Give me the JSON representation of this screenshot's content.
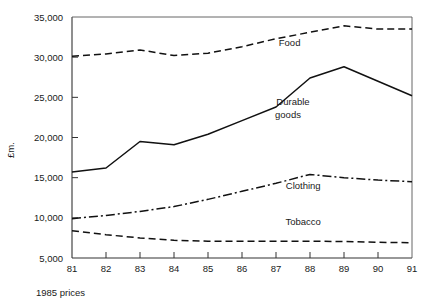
{
  "chart_data": {
    "type": "line",
    "title": "",
    "subtitle": "",
    "caption": "1985 prices",
    "xlabel": "",
    "ylabel": "£m.",
    "x": [
      81,
      82,
      83,
      84,
      85,
      86,
      87,
      88,
      89,
      90,
      91
    ],
    "xtick_labels": [
      "81",
      "82",
      "83",
      "84",
      "85",
      "86",
      "87",
      "88",
      "89",
      "90",
      "91"
    ],
    "ytick_labels": [
      "5,000",
      "10,000",
      "15,000",
      "20,000",
      "25,000",
      "30,000",
      "35,000"
    ],
    "ytick_values": [
      5000,
      10000,
      15000,
      20000,
      25000,
      30000,
      35000
    ],
    "xlim": [
      81,
      91
    ],
    "ylim": [
      5000,
      35000
    ],
    "grid": false,
    "legend_position": "inline-annotations",
    "series": [
      {
        "name": "Food",
        "style": "dashed",
        "label_x": 87.4,
        "label_y": 31400,
        "values": [
          30100,
          30400,
          30900,
          30200,
          30500,
          31300,
          32300,
          33100,
          33900,
          33500,
          33500
        ]
      },
      {
        "name": "Durable goods",
        "style": "solid",
        "label_x": 87.5,
        "label_y": 24100,
        "values": [
          15700,
          16200,
          19500,
          19100,
          20400,
          22100,
          23800,
          27400,
          28800,
          27000,
          25200
        ]
      },
      {
        "name": "Clothing",
        "style": "dash-dot",
        "label_x": 87.8,
        "label_y": 13600,
        "values": [
          9900,
          10300,
          10800,
          11400,
          12300,
          13300,
          14300,
          15400,
          15000,
          14700,
          14500
        ]
      },
      {
        "name": "Tobacco",
        "style": "dashed",
        "label_x": 87.8,
        "label_y": 9100,
        "values": [
          8400,
          7900,
          7500,
          7200,
          7100,
          7100,
          7100,
          7100,
          7050,
          6950,
          6900
        ]
      }
    ]
  },
  "labels": {
    "food": "Food",
    "durable_goods_line1": "Durable",
    "durable_goods_line2": "goods",
    "clothing": "Clothing",
    "tobacco": "Tobacco",
    "y_axis": "£m.",
    "caption": "1985 prices"
  }
}
